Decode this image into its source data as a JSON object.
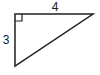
{
  "figure": {
    "kind": "right-triangle-diagram",
    "background_color": "#ffffff",
    "stroke_color": "#231f20",
    "stroke_width": 1.5,
    "text_color": "#1a1a1a",
    "vertices": {
      "top_left": {
        "x": 15,
        "y": 14
      },
      "top_right": {
        "x": 93,
        "y": 14
      },
      "bottom_left": {
        "x": 15,
        "y": 66
      }
    },
    "right_angle_marker": {
      "at_vertex": "top_left",
      "size": 7,
      "present": true
    },
    "labels": {
      "top_edge": "4",
      "left_edge": "3"
    }
  },
  "chart_data": {
    "type": "diagram",
    "title": "",
    "shape": "right triangle",
    "legs": [
      {
        "name": "horizontal leg",
        "label": "4",
        "length": 4,
        "orientation": "horizontal",
        "position": "top"
      },
      {
        "name": "vertical leg",
        "label": "3",
        "length": 3,
        "orientation": "vertical",
        "position": "left"
      }
    ],
    "hypotenuse": {
      "label": "",
      "length": 5,
      "from": "bottom_left",
      "to": "top_right"
    },
    "right_angle_at": "top_left",
    "annotations": [
      "4",
      "3"
    ]
  }
}
